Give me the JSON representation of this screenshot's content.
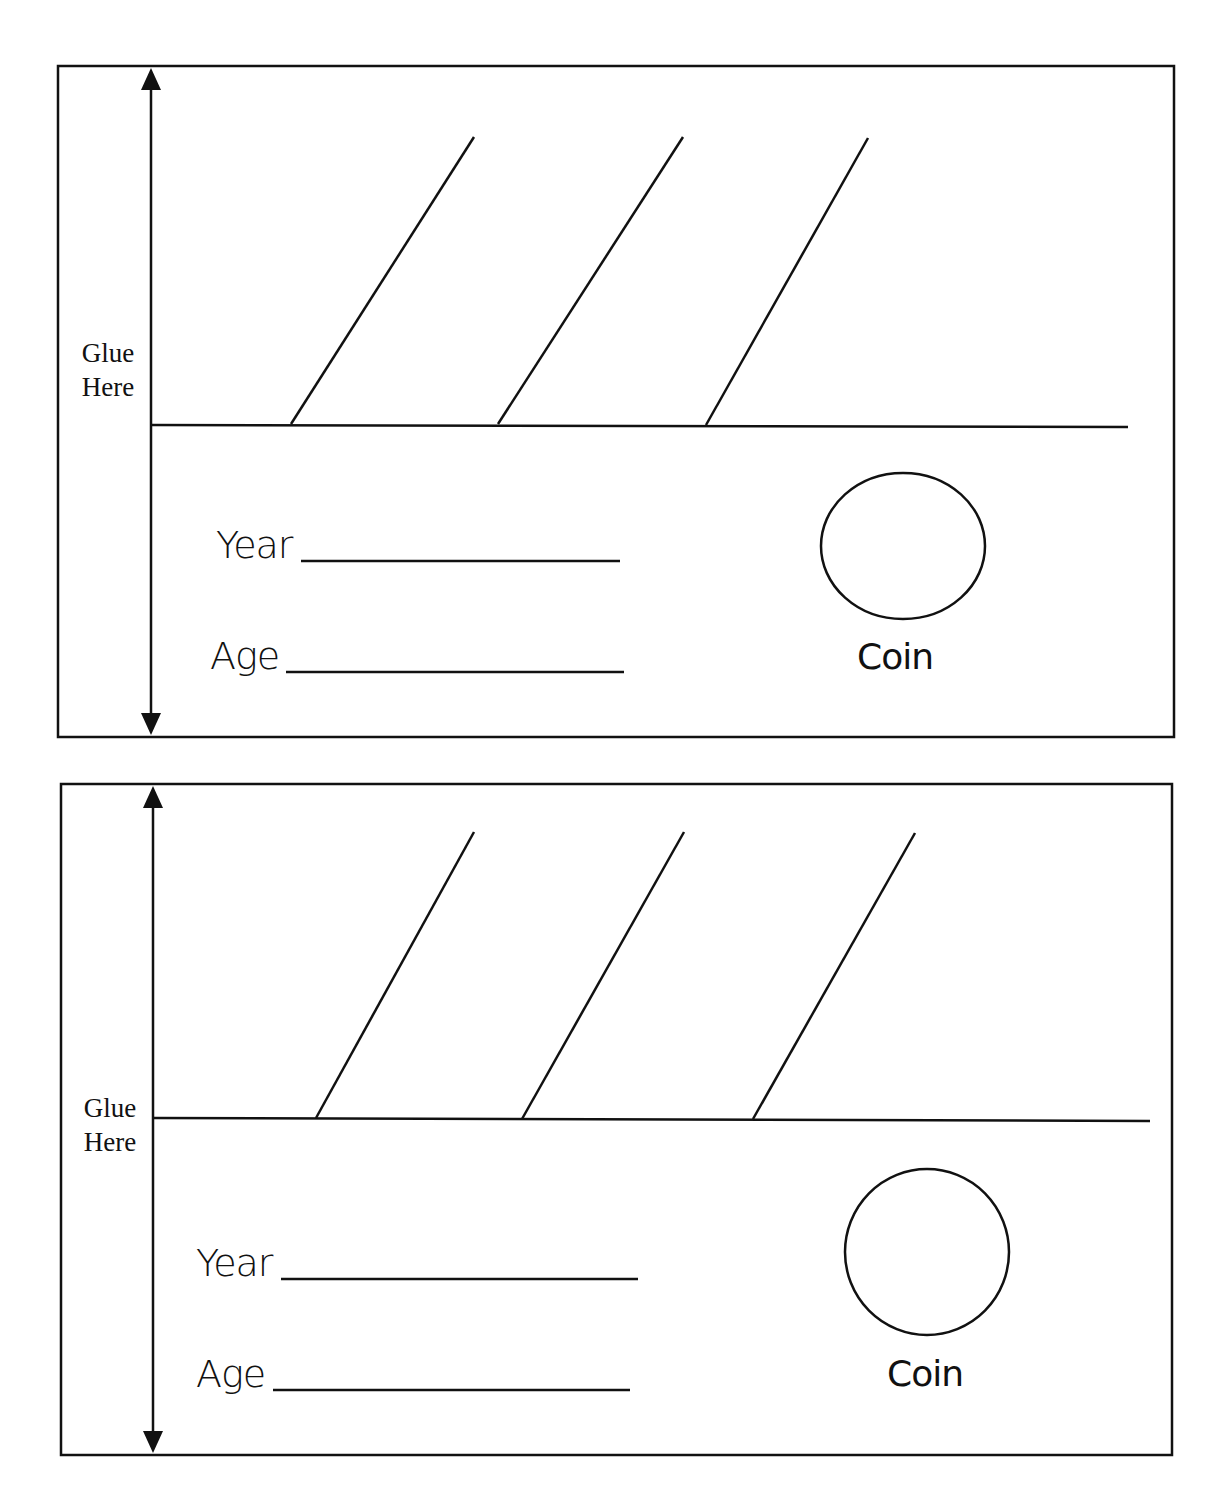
{
  "worksheet": {
    "cards": [
      {
        "glue_label_line1": "Glue",
        "glue_label_line2": "Here",
        "year_label": "Year",
        "age_label": "Age",
        "coin_label": "Coin"
      },
      {
        "glue_label_line1": "Glue",
        "glue_label_line2": "Here",
        "year_label": "Year",
        "age_label": "Age",
        "coin_label": "Coin"
      }
    ],
    "colors": {
      "ink": "#111111",
      "paper": "#ffffff"
    }
  }
}
